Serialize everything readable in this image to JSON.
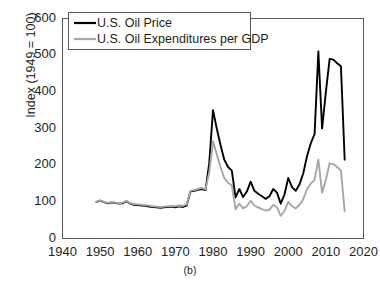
{
  "chart_data": {
    "type": "line",
    "title": "",
    "subtitle": "",
    "panel_label": "(b)",
    "xlabel": "",
    "ylabel": "Index (1949 = 100)",
    "xlim": [
      1940,
      2020
    ],
    "ylim": [
      0,
      600
    ],
    "xticks": [
      1940,
      1950,
      1960,
      1970,
      1980,
      1990,
      2000,
      2010,
      2020
    ],
    "yticks": [
      0,
      100,
      200,
      300,
      400,
      500,
      600
    ],
    "grid": false,
    "legend_position": "top-left",
    "series": [
      {
        "name": "U.S. Oil Price",
        "color": "#000000",
        "x": [
          1949,
          1950,
          1951,
          1952,
          1953,
          1954,
          1955,
          1956,
          1957,
          1958,
          1959,
          1960,
          1961,
          1962,
          1963,
          1964,
          1965,
          1966,
          1967,
          1968,
          1969,
          1970,
          1971,
          1972,
          1973,
          1974,
          1975,
          1976,
          1977,
          1978,
          1979,
          1980,
          1981,
          1982,
          1983,
          1984,
          1985,
          1986,
          1987,
          1988,
          1989,
          1990,
          1991,
          1992,
          1993,
          1994,
          1995,
          1996,
          1997,
          1998,
          1999,
          2000,
          2001,
          2002,
          2003,
          2004,
          2005,
          2006,
          2007,
          2008,
          2009,
          2010,
          2011,
          2012,
          2013,
          2014,
          2015
        ],
        "y": [
          100,
          103,
          99,
          96,
          98,
          97,
          95,
          96,
          102,
          95,
          92,
          91,
          90,
          89,
          87,
          86,
          85,
          84,
          85,
          86,
          87,
          85,
          88,
          86,
          90,
          128,
          130,
          133,
          135,
          132,
          205,
          350,
          300,
          255,
          215,
          195,
          185,
          112,
          135,
          113,
          128,
          155,
          130,
          122,
          115,
          108,
          115,
          135,
          125,
          95,
          120,
          165,
          140,
          130,
          148,
          178,
          225,
          260,
          285,
          510,
          300,
          400,
          490,
          488,
          478,
          470,
          215
        ]
      },
      {
        "name": "U.S. Oil Expenditures per GDP",
        "color": "#a6a6a6",
        "x": [
          1949,
          1950,
          1951,
          1952,
          1953,
          1954,
          1955,
          1956,
          1957,
          1958,
          1959,
          1960,
          1961,
          1962,
          1963,
          1964,
          1965,
          1966,
          1967,
          1968,
          1969,
          1970,
          1971,
          1972,
          1973,
          1974,
          1975,
          1976,
          1977,
          1978,
          1979,
          1980,
          1981,
          1982,
          1983,
          1984,
          1985,
          1986,
          1987,
          1988,
          1989,
          1990,
          1991,
          1992,
          1993,
          1994,
          1995,
          1996,
          1997,
          1998,
          1999,
          2000,
          2001,
          2002,
          2003,
          2004,
          2005,
          2006,
          2007,
          2008,
          2009,
          2010,
          2011,
          2012,
          2013,
          2014,
          2015
        ],
        "y": [
          100,
          104,
          100,
          97,
          99,
          98,
          96,
          98,
          103,
          96,
          94,
          93,
          92,
          91,
          90,
          88,
          87,
          86,
          87,
          88,
          89,
          88,
          90,
          89,
          93,
          130,
          132,
          135,
          138,
          134,
          180,
          265,
          230,
          195,
          165,
          152,
          145,
          80,
          95,
          82,
          88,
          103,
          90,
          85,
          80,
          76,
          78,
          92,
          85,
          62,
          75,
          100,
          88,
          82,
          92,
          108,
          135,
          150,
          160,
          215,
          125,
          160,
          205,
          203,
          195,
          185,
          75
        ]
      }
    ]
  },
  "legend": {
    "items": [
      {
        "label": "U.S. Oil Price"
      },
      {
        "label": "U.S. Oil Expenditures per GDP"
      }
    ]
  },
  "axis": {
    "ylabel": "Index (1949 = 100)",
    "yticks": [
      "600",
      "500",
      "400",
      "300",
      "200",
      "100",
      "0"
    ],
    "xticks": [
      "1940",
      "1950",
      "1960",
      "1970",
      "1980",
      "1990",
      "2000",
      "2010",
      "2020"
    ],
    "panel_label": "(b)"
  }
}
